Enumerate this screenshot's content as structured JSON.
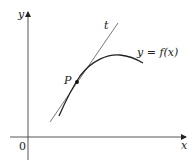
{
  "diagram": {
    "axes": {
      "x_label": "x",
      "y_label": "y",
      "origin_label": "0"
    },
    "curve": {
      "label": "y = f(x)"
    },
    "tangent": {
      "label": "t"
    },
    "point": {
      "label": "P"
    },
    "colors": {
      "stroke": "#222222",
      "background": "#ffffff"
    }
  }
}
